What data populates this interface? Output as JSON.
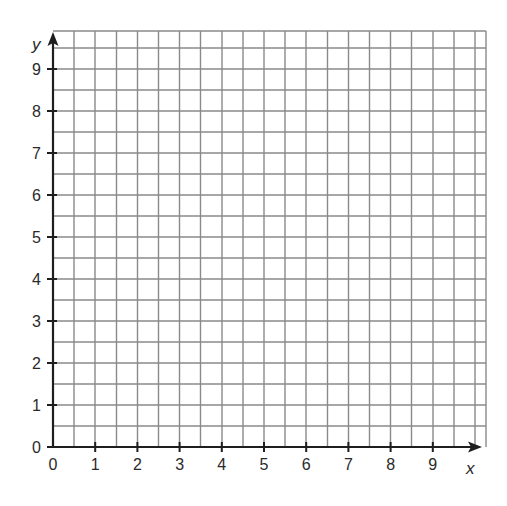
{
  "diagram": {
    "type": "blank-coordinate-grid",
    "x_axis": {
      "label": "x",
      "min": 0,
      "max": 9,
      "tick_labels": [
        "0",
        "1",
        "2",
        "3",
        "4",
        "5",
        "6",
        "7",
        "8",
        "9"
      ]
    },
    "y_axis": {
      "label": "y",
      "min": 0,
      "max": 9,
      "tick_labels": [
        "0",
        "1",
        "2",
        "3",
        "4",
        "5",
        "6",
        "7",
        "8",
        "9"
      ]
    },
    "grid": {
      "minor_step": 0.5,
      "extent_units": 10,
      "line_color": "#8a8a8a",
      "axis_color": "#1e1e1e"
    },
    "origin_label": "0"
  }
}
